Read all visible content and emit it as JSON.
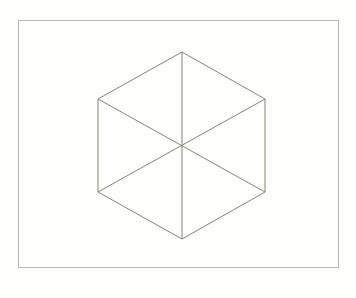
{
  "canvas": {
    "width": 356,
    "height": 298,
    "background": "#fefefc"
  },
  "frame": {
    "x": 18,
    "y": 20,
    "width": 320,
    "height": 247,
    "stroke": "#b9b9b6",
    "fill": "#fefefc"
  },
  "hexagon": {
    "stroke": "#858574",
    "center": [
      182,
      146
    ],
    "vertices": [
      [
        182,
        52
      ],
      [
        265,
        99
      ],
      [
        265,
        192
      ],
      [
        182,
        239
      ],
      [
        98,
        192
      ],
      [
        98,
        99
      ]
    ],
    "spokes": [
      [
        [
          182,
          52
        ],
        [
          182,
          239
        ]
      ],
      [
        [
          98,
          99
        ],
        [
          265,
          192
        ]
      ],
      [
        [
          265,
          99
        ],
        [
          98,
          192
        ]
      ]
    ]
  }
}
